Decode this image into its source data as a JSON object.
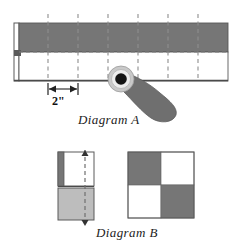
{
  "page": {
    "background": "#ffffff",
    "width": 243,
    "height": 246
  },
  "colors": {
    "dark_gray": "#767676",
    "mid_gray": "#8a8a8a",
    "light_gray": "#c9c9c9",
    "pale_gray": "#bdbdbd",
    "white": "#ffffff",
    "outline": "#4a4a4a",
    "dash": "#8e8e8e",
    "ink": "#1c1c1c"
  },
  "diagram_a": {
    "label": "Diagram A",
    "dimension_label": "2\"",
    "board": {
      "x": 14,
      "y": 23,
      "width": 214,
      "height": 58,
      "top_half_fill": "#767676",
      "bottom_half_fill": "#ffffff",
      "fold_line_y": 52
    },
    "grid_dashes_x": [
      48,
      78,
      108,
      138,
      168,
      198
    ],
    "dash_top_overshoot": 9,
    "knob": {
      "cx": 121,
      "cy": 79,
      "outer_r": 13,
      "outer_fill": "#cfcfcf",
      "mid_r": 10,
      "mid_fill": "#e8e8e8",
      "hub_r": 6,
      "hub_fill": "#121212"
    },
    "handle_fill": "#6f6f6f",
    "dimension": {
      "from_x": 48,
      "to_x": 78,
      "y": 88
    }
  },
  "diagram_b": {
    "label": "Diagram B",
    "folded": {
      "x": 58,
      "y": 152,
      "width": 36,
      "height": 68,
      "spine_width": 6,
      "spine_fill": "#767676",
      "top_fill": "#ffffff",
      "bottom_fill": "#bdbdbd",
      "mid_y": 188,
      "dashed_x": 85,
      "arrow_top": "up",
      "arrow_bottom": "down"
    },
    "quad": {
      "x": 128,
      "y": 152,
      "size": 66,
      "cells": [
        {
          "position": "top-left",
          "fill": "#767676"
        },
        {
          "position": "top-right",
          "fill": "#ffffff"
        },
        {
          "position": "bottom-left",
          "fill": "#ffffff"
        },
        {
          "position": "bottom-right",
          "fill": "#767676"
        }
      ]
    }
  }
}
